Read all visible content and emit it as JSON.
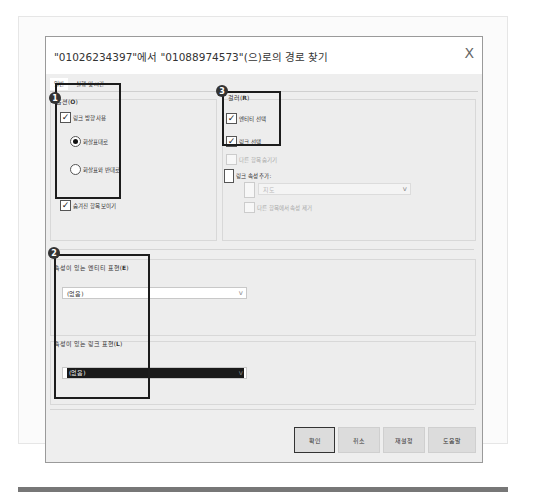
{
  "dialog": {
    "title": "\"01026234397\"에서 \"01088974573\"(으)로의 경로 찾기",
    "close_label": "X",
    "tabs": [
      {
        "label": "일반",
        "active": true
      },
      {
        "label": "실행 및 시간",
        "active": false
      }
    ]
  },
  "options_group": {
    "badge": "1",
    "label": "옵션(",
    "accel": "O",
    "label_end": ")",
    "use_link_direction": {
      "label": "링크 방향 사용",
      "checked": true
    },
    "radio_forward": {
      "label": "화살표대로",
      "selected": true
    },
    "radio_reverse": {
      "label": "화살표와 반대로",
      "selected": false
    },
    "show_hidden": {
      "label": "숨겨진 항목 보이기",
      "checked": true
    }
  },
  "filter_group": {
    "badge": "3",
    "label": "걸러(",
    "accel": "R",
    "label_end": ")",
    "entity_select": {
      "label": "엔티티 선택",
      "checked": true
    },
    "link_select": {
      "label": "링크 선택",
      "checked": true
    },
    "hide_other": {
      "label": "다른 항목 숨기기",
      "checked": false
    },
    "link_attr_add": {
      "label": "링크 속성 추가:",
      "checked": false
    },
    "attr_dropdown": {
      "value": "지도",
      "chevron": "v"
    },
    "remove_attr": {
      "label": "다른 항목에서 속성 제거",
      "checked": false
    }
  },
  "expr_group": {
    "badge": "2",
    "entity_label": "속성이 있는 엔티티 표현(",
    "entity_accel": "E",
    "entity_end": ")",
    "entity_value": "(없음)",
    "link_label": "속성이 있는 링크 표현(",
    "link_accel": "L",
    "link_end": ")",
    "link_value": "(없음)",
    "chevron": "v"
  },
  "buttons": {
    "ok": "확인",
    "cancel": "취소",
    "reset": "재설정",
    "help": "도움말"
  },
  "icons": {
    "check": "✓"
  }
}
